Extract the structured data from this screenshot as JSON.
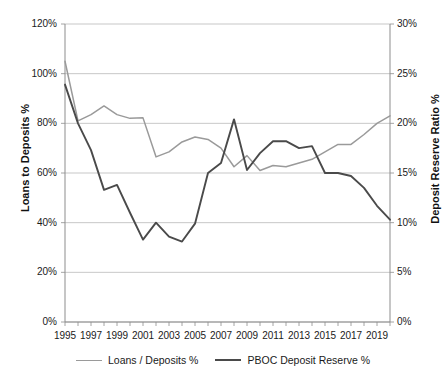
{
  "chart_data": {
    "type": "line",
    "title": "",
    "xlabel": "",
    "grid": "horizontal",
    "legend_position": "bottom",
    "x": [
      1995,
      1996,
      1997,
      1998,
      1999,
      2000,
      2001,
      2002,
      2003,
      2004,
      2005,
      2006,
      2007,
      2008,
      2009,
      2010,
      2011,
      2012,
      2013,
      2014,
      2015,
      2016,
      2017,
      2018,
      2019,
      2020
    ],
    "x_tick_labels": [
      "1995",
      "1997",
      "1999",
      "2001",
      "2003",
      "2005",
      "2007",
      "2009",
      "2011",
      "2013",
      "2015",
      "2017",
      "2019"
    ],
    "x_tick_years": [
      1995,
      1997,
      1999,
      2001,
      2003,
      2005,
      2007,
      2009,
      2011,
      2013,
      2015,
      2017,
      2019
    ],
    "axes": {
      "left": {
        "label": "Loans to Deposits %",
        "ylim": [
          0,
          120
        ],
        "tick_values": [
          0,
          20,
          40,
          60,
          80,
          100,
          120
        ],
        "tick_labels": [
          "0%",
          "20%",
          "40%",
          "60%",
          "80%",
          "100%",
          "120%"
        ]
      },
      "right": {
        "label": "Deposit Reserve Ratio %",
        "ylim": [
          0,
          30
        ],
        "tick_values": [
          0,
          5,
          10,
          15,
          20,
          25,
          30
        ],
        "tick_labels": [
          "0%",
          "5%",
          "10%",
          "15%",
          "20%",
          "25%",
          "30%"
        ]
      }
    },
    "series": [
      {
        "name": "Loans / Deposits %",
        "axis": "left",
        "color": "#9a9a9a",
        "values": [
          105.0,
          81.0,
          83.5,
          87.0,
          83.5,
          82.0,
          82.2,
          66.5,
          68.5,
          72.5,
          74.5,
          73.5,
          70.0,
          62.5,
          67.0,
          61.0,
          63.0,
          62.5,
          64.0,
          65.5,
          68.5,
          71.5,
          71.5,
          75.5,
          80.0,
          83.0
        ]
      },
      {
        "name": "PBOC Deposit Reserve %",
        "axis": "right",
        "color": "#4a4a4a",
        "values": [
          23.9,
          20.0,
          17.3,
          13.3,
          13.8,
          11.0,
          8.3,
          10.0,
          8.6,
          8.1,
          9.9,
          15.0,
          16.0,
          20.4,
          15.3,
          17.0,
          18.2,
          18.2,
          17.5,
          17.7,
          15.0,
          15.0,
          14.7,
          13.5,
          11.7,
          10.3
        ]
      }
    ]
  },
  "legend": {
    "items": [
      {
        "label": "Loans / Deposits %",
        "color": "#9a9a9a"
      },
      {
        "label": "PBOC Deposit Reserve %",
        "color": "#4a4a4a"
      }
    ]
  }
}
